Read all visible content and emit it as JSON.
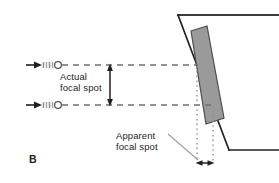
{
  "figure": {
    "panel_letter": "B",
    "title_hidden": "X-ray tube line focus principle — actual versus apparent focal spot",
    "labels": {
      "actual_line1": "Actual",
      "actual_line2": "focal spot",
      "apparent_line1": "Apparent",
      "apparent_line2": "focal spot"
    },
    "colors": {
      "ink": "#231f20",
      "target_fill": "#9a9a9a",
      "target_stroke": "#4d4d4d",
      "dash_gray": "#6f6f6f",
      "dot_gray": "#8c8c8c",
      "leader_gray": "#a0a0a0",
      "beam_gray": "#b5b5b5",
      "background": "#ffffff"
    },
    "geometry": {
      "electron_beam_upper_y": 65,
      "electron_beam_lower_y": 105,
      "actual_spot_arrow_x": 110,
      "apparent_spot_arrow_y": 163,
      "anode_angle_label": "angled target"
    }
  }
}
